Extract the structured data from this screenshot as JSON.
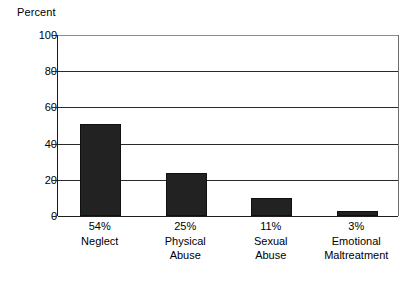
{
  "chart_data": {
    "type": "bar",
    "title": "",
    "subtitle": "",
    "xlabel": "",
    "ylabel": "Percent",
    "ylim": [
      0,
      100
    ],
    "yticks": [
      0,
      20,
      40,
      60,
      80,
      100
    ],
    "grid": true,
    "legend": "none",
    "orientation": "vertical",
    "bar_color": "#222222",
    "categories": [
      "Neglect",
      "Physical Abuse",
      "Sexual Abuse",
      "Emotional Maltreatment"
    ],
    "category_lines": [
      [
        "Neglect"
      ],
      [
        "Physical",
        "Abuse"
      ],
      [
        "Sexual",
        "Abuse"
      ],
      [
        "Emotional",
        "Maltreatment"
      ]
    ],
    "data_labels": [
      "54%",
      "25%",
      "11%",
      "3%"
    ],
    "values": [
      51,
      24,
      10,
      3
    ],
    "points": [
      {
        "label": "54%",
        "category": "Neglect",
        "value": 51
      },
      {
        "label": "25%",
        "category": "Physical Abuse",
        "value": 24
      },
      {
        "label": "11%",
        "category": "Sexual Abuse",
        "value": 10
      },
      {
        "label": "3%",
        "category": "Emotional Maltreatment",
        "value": 3
      }
    ]
  },
  "axis": {
    "y_title": "Percent",
    "y_tick_labels": [
      "100",
      "80",
      "60",
      "40",
      "20",
      "0"
    ]
  },
  "xlabels": [
    {
      "pct": "54%",
      "line1": "Neglect",
      "line2": ""
    },
    {
      "pct": "25%",
      "line1": "Physical",
      "line2": "Abuse"
    },
    {
      "pct": "11%",
      "line1": "Sexual",
      "line2": "Abuse"
    },
    {
      "pct": "3%",
      "line1": "Emotional",
      "line2": "Maltreatment"
    }
  ],
  "colors": {
    "bar": "#222222",
    "grid": "#2b2b2b",
    "axis": "#1a1a1a",
    "text": "#000000",
    "background": "#ffffff"
  }
}
